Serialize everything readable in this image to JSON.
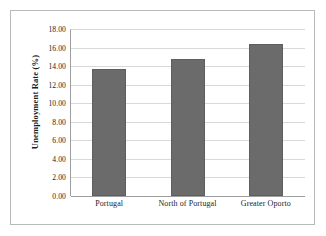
{
  "chart_data": {
    "type": "bar",
    "title": "",
    "subtitle": "",
    "xlabel": "",
    "ylabel": "Unemployment Rate (%)",
    "categories": [
      "Portugal",
      "North of Portugal",
      "Greater Oporto"
    ],
    "values": [
      13.7,
      14.8,
      16.4
    ],
    "series": [
      {
        "name": "Unemployment Rate",
        "values": [
          13.7,
          14.8,
          16.4
        ]
      }
    ],
    "ylim": [
      0,
      18
    ],
    "ytick_step": 2,
    "ytick_labels": [
      "18.00",
      "16.00",
      "14.00",
      "12.00",
      "10.00",
      "8.00",
      "6.00",
      "4.00",
      "2.00",
      "0.00"
    ],
    "ytick_values": [
      18,
      16,
      14,
      12,
      10,
      8,
      6,
      4,
      2,
      0
    ],
    "grid": "horizontal",
    "legend": "none",
    "bar_color": "#6b6b6b",
    "bar_edge_color": "#5e5e5e",
    "gridline_color": "#d9d9d9",
    "axis_color": "#9f9f9f",
    "frame_color": "#b9b9b9",
    "background_color": "#ffffff",
    "text_color": "#1c1c1c"
  }
}
